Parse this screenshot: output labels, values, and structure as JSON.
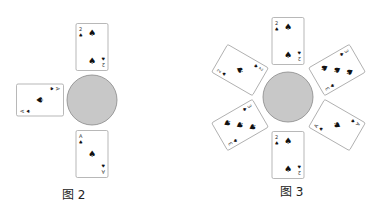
{
  "figures": [
    {
      "caption": "图 2",
      "cards": [
        {
          "position": "top",
          "corner": "2",
          "pips": 2,
          "suit": "♠"
        },
        {
          "position": "left",
          "corner": "A",
          "pips": 1,
          "suit": "♠"
        },
        {
          "position": "bottom",
          "corner": "A",
          "pips": 1,
          "suit": "♠"
        }
      ]
    },
    {
      "caption": "图 3",
      "cards": [
        {
          "position": "top",
          "corner": "2",
          "pips": 2,
          "suit": "♠"
        },
        {
          "position": "upper-left",
          "corner": "2",
          "pips": 1,
          "suit": "♠"
        },
        {
          "position": "upper-right",
          "corner": "3",
          "pips": 3,
          "suit": "♠"
        },
        {
          "position": "lower-left",
          "corner": "3",
          "pips": 3,
          "suit": "♠"
        },
        {
          "position": "lower-right",
          "corner": "A",
          "pips": 1,
          "suit": "♠"
        },
        {
          "position": "bottom",
          "corner": "2",
          "pips": 2,
          "suit": "♠"
        }
      ]
    }
  ],
  "colors": {
    "circle_fill": "#c8c8c8",
    "circle_stroke": "#888888",
    "card_stroke": "#999999"
  }
}
